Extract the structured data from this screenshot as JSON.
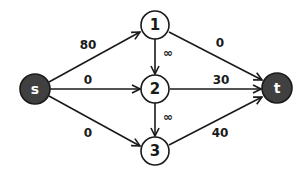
{
  "diagram": {
    "type": "flow-network",
    "nodes": [
      {
        "id": "s",
        "label": "s",
        "style": "dark",
        "x": 35,
        "y": 89
      },
      {
        "id": "1",
        "label": "1",
        "style": "light",
        "x": 155,
        "y": 25
      },
      {
        "id": "2",
        "label": "2",
        "style": "light",
        "x": 155,
        "y": 89
      },
      {
        "id": "3",
        "label": "3",
        "style": "light",
        "x": 155,
        "y": 151
      },
      {
        "id": "t",
        "label": "t",
        "style": "dark",
        "x": 277,
        "y": 88
      }
    ],
    "edges": [
      {
        "from": "s",
        "to": "1",
        "label": "80"
      },
      {
        "from": "s",
        "to": "2",
        "label": "0"
      },
      {
        "from": "s",
        "to": "3",
        "label": "0"
      },
      {
        "from": "1",
        "to": "2",
        "label": "∞"
      },
      {
        "from": "2",
        "to": "3",
        "label": "∞"
      },
      {
        "from": "1",
        "to": "t",
        "label": "0"
      },
      {
        "from": "2",
        "to": "t",
        "label": "30"
      },
      {
        "from": "3",
        "to": "t",
        "label": "40"
      }
    ]
  }
}
